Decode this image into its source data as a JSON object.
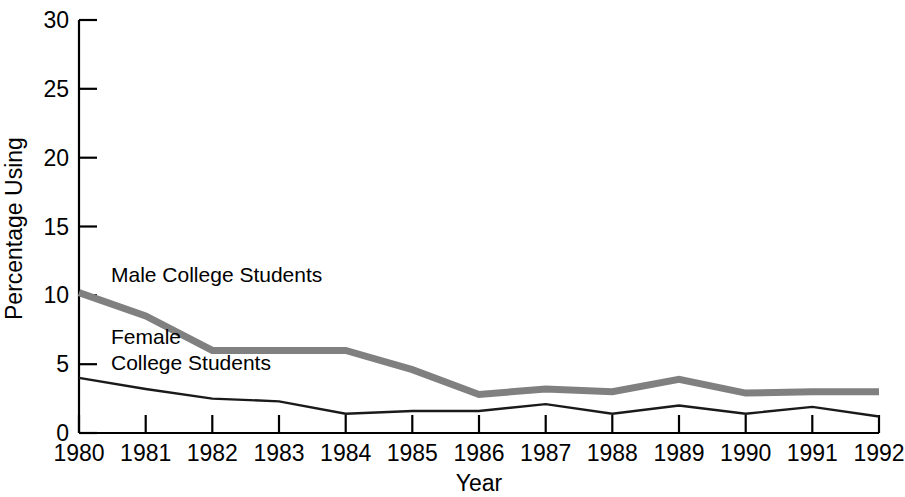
{
  "chart_data": {
    "type": "line",
    "title": "",
    "xlabel": "Year",
    "ylabel": "Percentage Using",
    "x": [
      1980,
      1981,
      1982,
      1983,
      1984,
      1985,
      1986,
      1987,
      1988,
      1989,
      1990,
      1991,
      1992
    ],
    "categories": [
      "1980",
      "1981",
      "1982",
      "1983",
      "1984",
      "1985",
      "1986",
      "1987",
      "1988",
      "1989",
      "1990",
      "1991",
      "1992"
    ],
    "xlim": [
      1980,
      1992
    ],
    "ylim": [
      0,
      30
    ],
    "yticks": [
      0,
      5,
      10,
      15,
      20,
      25,
      30
    ],
    "ytick_labels": [
      "0",
      "5",
      "10",
      "15",
      "20",
      "25",
      "30"
    ],
    "grid": false,
    "legend": "inline-annotations",
    "series": [
      {
        "name": "Male College Students",
        "color": "#808080",
        "width": 7,
        "values": [
          10.2,
          8.5,
          6.0,
          6.0,
          6.0,
          4.6,
          2.8,
          3.2,
          3.0,
          3.9,
          2.9,
          3.0,
          3.0
        ]
      },
      {
        "name": "Female College Students",
        "color": "#1a1a1a",
        "width": 2.4,
        "values": [
          4.0,
          3.2,
          2.5,
          2.3,
          1.4,
          1.6,
          1.6,
          2.1,
          1.4,
          2.0,
          1.4,
          1.9,
          1.2
        ]
      }
    ],
    "annotations": [
      {
        "id": "male-label",
        "text": "Male College Students",
        "x": 111,
        "y": 282
      },
      {
        "id": "female-label-line1",
        "text": "Female",
        "x": 111,
        "y": 344
      },
      {
        "id": "female-label-line2",
        "text": "College Students",
        "x": 111,
        "y": 370
      }
    ]
  },
  "axes": {
    "y_axis_label": "Percentage Using",
    "x_axis_label": "Year"
  },
  "colors": {
    "male_line": "#808080",
    "female_line": "#1a1a1a",
    "axis": "#000000",
    "background": "#ffffff"
  }
}
